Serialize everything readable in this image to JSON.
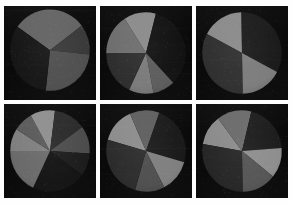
{
  "figure": {
    "title": "",
    "background_color": "#fefefe",
    "panel_background_color": "#0b0b0b",
    "rows": 2,
    "columns": 3,
    "panel_count": 6
  },
  "palette": {
    "darkest": "#121212",
    "very_dark": "#1b1b1b",
    "dark": "#262626",
    "dark_mid": "#333333",
    "mid": "#4a4a4a",
    "mid_light": "#636363",
    "light": "#7d7d7d",
    "lightest": "#969696"
  },
  "chart_data": [
    {
      "type": "pie",
      "title": "",
      "xlabel": "",
      "ylabel": "",
      "start_angle": 55,
      "radius_fraction": 0.92,
      "center": [
        0.5,
        0.47
      ],
      "grid": false,
      "legend": "none",
      "categories": [
        "A",
        "B",
        "C",
        "D"
      ],
      "values": [
        30,
        12,
        25,
        33
      ],
      "colors": [
        "#636363",
        "#3a3a3a",
        "#4f4f4f",
        "#161616"
      ],
      "labels": [
        "",
        "",
        "",
        ""
      ]
    },
    {
      "type": "pie",
      "title": "",
      "xlabel": "",
      "ylabel": "",
      "start_angle": 90,
      "radius_fraction": 0.92,
      "center": [
        0.5,
        0.5
      ],
      "grid": false,
      "legend": "none",
      "categories": [
        "A",
        "B",
        "C",
        "D",
        "E",
        "F"
      ],
      "values": [
        16,
        13,
        34,
        9,
        10,
        18
      ],
      "colors": [
        "#6e6e6e",
        "#8a8a8a",
        "#121212",
        "#5c5c5c",
        "#7a7a7a",
        "#2e2e2e"
      ],
      "labels": [
        "",
        "",
        "",
        "",
        "",
        ""
      ]
    },
    {
      "type": "pie",
      "title": "",
      "xlabel": "",
      "ylabel": "",
      "start_angle": 62,
      "radius_fraction": 0.92,
      "center": [
        0.5,
        0.5
      ],
      "grid": false,
      "legend": "none",
      "categories": [
        "A",
        "B",
        "C",
        "D"
      ],
      "values": [
        17,
        33,
        17,
        33
      ],
      "colors": [
        "#8a8a8a",
        "#1b1b1b",
        "#7c7c7c",
        "#303030"
      ],
      "labels": [
        "",
        "",
        "",
        ""
      ]
    },
    {
      "type": "pie",
      "title": "",
      "xlabel": "",
      "ylabel": "",
      "start_angle": 90,
      "radius_fraction": 0.92,
      "center": [
        0.5,
        0.5
      ],
      "grid": false,
      "legend": "none",
      "categories": [
        "A",
        "B",
        "C",
        "D",
        "E",
        "F",
        "G",
        "H"
      ],
      "values": [
        9,
        8,
        10,
        13,
        11,
        9,
        22,
        18
      ],
      "colors": [
        "#7f7f7f",
        "#5a5a5a",
        "#8e8e8e",
        "#2a2a2a",
        "#4c4c4c",
        "#1c1c1c",
        "#131313",
        "#6a6a6a"
      ],
      "labels": [
        "",
        "",
        "",
        "",
        "",
        "",
        "",
        ""
      ]
    },
    {
      "type": "pie",
      "title": "",
      "xlabel": "",
      "ylabel": "",
      "start_angle": 74,
      "radius_fraction": 0.92,
      "center": [
        0.5,
        0.5
      ],
      "grid": false,
      "legend": "none",
      "categories": [
        "A",
        "B",
        "C",
        "D",
        "E",
        "F"
      ],
      "values": [
        14,
        12,
        24,
        13,
        12,
        25
      ],
      "colors": [
        "#8c8c8c",
        "#5e5e5e",
        "#1a1a1a",
        "#7f7f7f",
        "#4e4e4e",
        "#2c2c2c"
      ],
      "labels": [
        "",
        "",
        "",
        "",
        "",
        ""
      ]
    },
    {
      "type": "pie",
      "title": "",
      "xlabel": "",
      "ylabel": "",
      "start_angle": 80,
      "radius_fraction": 0.92,
      "center": [
        0.5,
        0.5
      ],
      "grid": false,
      "legend": "none",
      "categories": [
        "A",
        "B",
        "C",
        "D",
        "E",
        "F"
      ],
      "values": [
        12,
        14,
        20,
        12,
        14,
        28
      ],
      "colors": [
        "#8b8b8b",
        "#6a6a6a",
        "#1d1d1d",
        "#8e8e8e",
        "#555555",
        "#262626"
      ],
      "labels": [
        "",
        "",
        "",
        "",
        "",
        ""
      ]
    }
  ],
  "panels": [
    {
      "name": "pie-chart-1",
      "position": "row-1-col-1"
    },
    {
      "name": "pie-chart-2",
      "position": "row-1-col-2"
    },
    {
      "name": "pie-chart-3",
      "position": "row-1-col-3"
    },
    {
      "name": "pie-chart-4",
      "position": "row-2-col-1"
    },
    {
      "name": "pie-chart-5",
      "position": "row-2-col-2"
    },
    {
      "name": "pie-chart-6",
      "position": "row-2-col-3"
    }
  ]
}
